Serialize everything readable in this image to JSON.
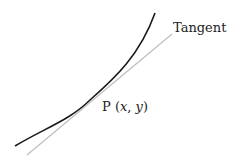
{
  "diagram": {
    "title": "",
    "tangent_label": "Tangent",
    "point_label": {
      "prefix": "P (",
      "x": "x",
      "sep": ", ",
      "y": "y",
      "suffix": ")"
    },
    "colors": {
      "curve": "#1a1a1a",
      "tangent": "#c0c0c0",
      "background": "#ffffff"
    }
  }
}
